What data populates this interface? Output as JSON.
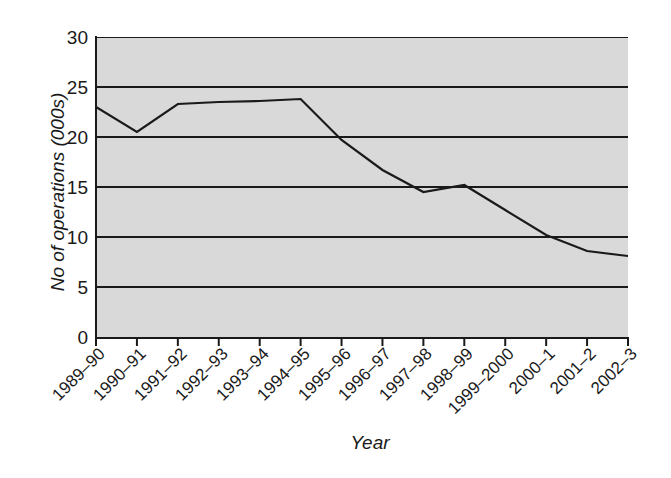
{
  "chart_data": {
    "type": "line",
    "title": "",
    "xlabel": "Year",
    "ylabel": "No of operations (000s)",
    "categories": [
      "1989–90",
      "1990–91",
      "1991–92",
      "1992–93",
      "1993–94",
      "1994–95",
      "1995–96",
      "1996–97",
      "1997–98",
      "1998–99",
      "1999–2000",
      "2000–1",
      "2001–2",
      "2002–3"
    ],
    "values": [
      23.0,
      20.5,
      23.3,
      23.5,
      23.6,
      23.8,
      19.7,
      16.7,
      14.5,
      15.2,
      12.7,
      10.2,
      8.6,
      8.1
    ],
    "series": [
      {
        "name": "No of operations (000s)",
        "values": [
          23.0,
          20.5,
          23.3,
          23.5,
          23.6,
          23.8,
          19.7,
          16.7,
          14.5,
          15.2,
          12.7,
          10.2,
          8.6,
          8.1
        ]
      }
    ],
    "ylim": [
      0,
      30
    ],
    "yticks": [
      0,
      5,
      10,
      15,
      20,
      25,
      30
    ],
    "ytick_labels": [
      "0",
      "5",
      "10",
      "15",
      "20",
      "25",
      "30"
    ],
    "grid": "horizontal",
    "legend": "none",
    "line_color": "#1a1a1a",
    "plot_background": "#d9d9d9",
    "figure_background": "#ffffff",
    "axis_color": "#1a1a1a"
  },
  "axes": {
    "y_title": "No of operations (000s)",
    "x_title": "Year"
  }
}
